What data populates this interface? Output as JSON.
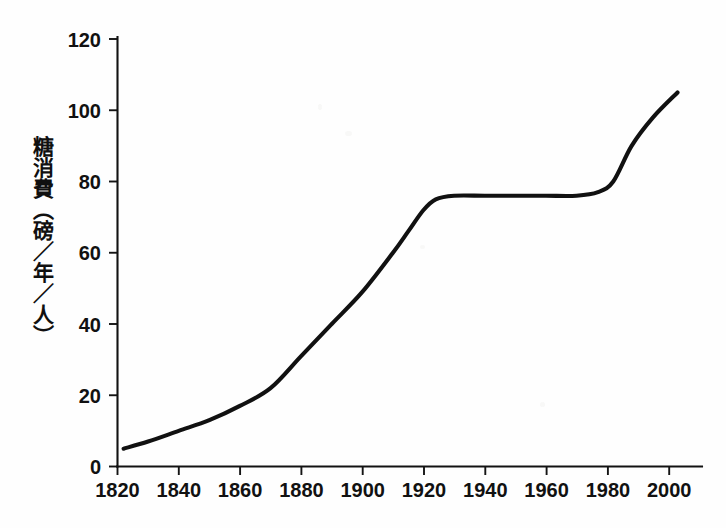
{
  "chart_data": {
    "type": "line",
    "title": "",
    "subtitle": "",
    "xlabel": "",
    "ylabel": "糖消費（磅／年／人）",
    "xlim": [
      1820,
      2011
    ],
    "ylim": [
      0,
      120
    ],
    "grid": false,
    "legend": false,
    "legend_position": "none",
    "x_ticks": [
      1820,
      1840,
      1860,
      1880,
      1900,
      1920,
      1940,
      1960,
      1980,
      2000
    ],
    "x_tick_labels": [
      "1820",
      "1840",
      "1860",
      "1880",
      "1900",
      "1920",
      "1940",
      "1960",
      "1980",
      "2000"
    ],
    "y_ticks": [
      0,
      20,
      40,
      60,
      80,
      100,
      120
    ],
    "y_tick_labels": [
      "0",
      "20",
      "40",
      "60",
      "80",
      "100",
      "120"
    ],
    "series": [
      {
        "name": "糖消費",
        "color": "#111111",
        "x": [
          1822,
          1830,
          1840,
          1850,
          1860,
          1870,
          1880,
          1890,
          1900,
          1910,
          1915,
          1920,
          1924,
          1930,
          1940,
          1950,
          1960,
          1970,
          1977,
          1982,
          1988,
          1995,
          2003
        ],
        "values": [
          5,
          7,
          10,
          13,
          17,
          22,
          31,
          40,
          49,
          60,
          66,
          72,
          75,
          76,
          76,
          76,
          76,
          76,
          77,
          80,
          90,
          98,
          105
        ]
      }
    ],
    "annotations": []
  },
  "axis": {
    "y_title": "糖消費（磅／年／人）"
  }
}
